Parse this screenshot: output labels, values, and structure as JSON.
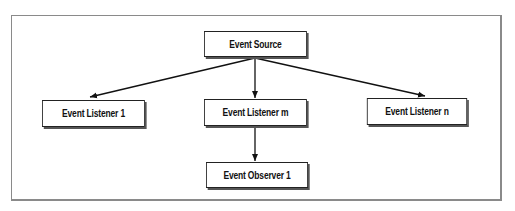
{
  "diagram": {
    "type": "flow",
    "nodes": [
      {
        "id": "source",
        "label": "Event Source"
      },
      {
        "id": "listener1",
        "label": "Event Listener 1"
      },
      {
        "id": "listenerm",
        "label": "Event Listener m"
      },
      {
        "id": "listenern",
        "label": "Event Listener n"
      },
      {
        "id": "observer1",
        "label": "Event Observer 1"
      }
    ],
    "edges": [
      {
        "from": "source",
        "to": "listener1"
      },
      {
        "from": "source",
        "to": "listenerm"
      },
      {
        "from": "source",
        "to": "listenern"
      },
      {
        "from": "listenerm",
        "to": "observer1"
      }
    ],
    "colors": {
      "border": "#222222",
      "frame": "#8a8a8a",
      "background": "#ffffff"
    }
  }
}
